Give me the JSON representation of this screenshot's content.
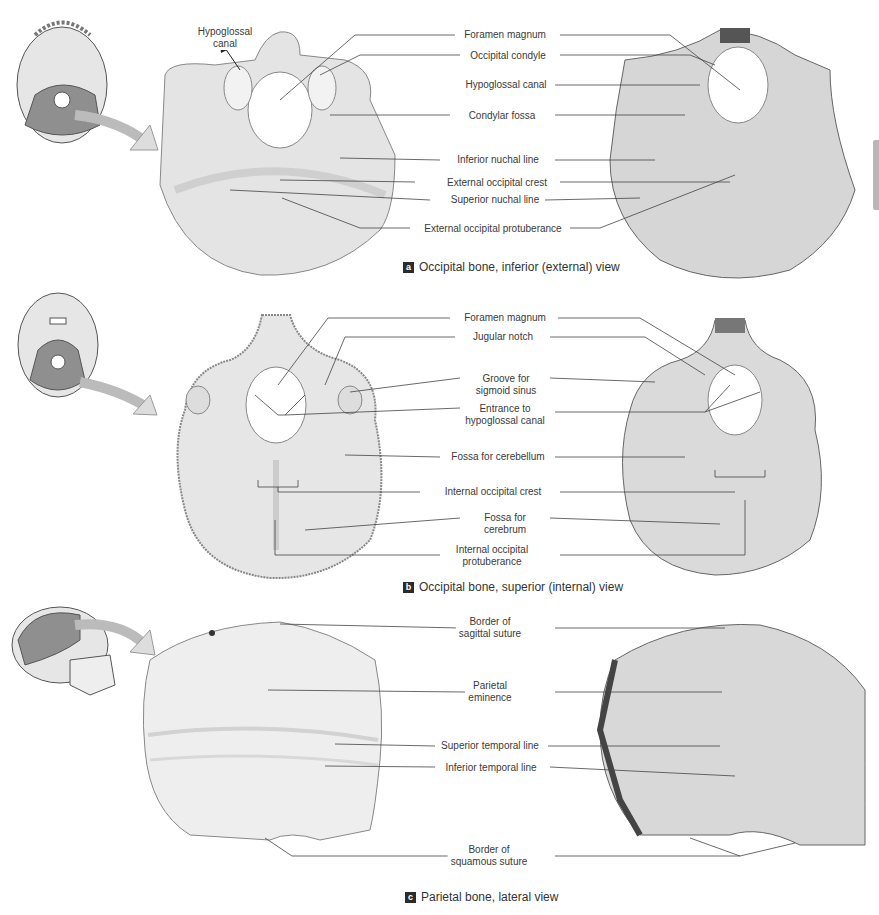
{
  "figure": {
    "panels": [
      {
        "id": "a",
        "caption": "Occipital bone, inferior (external) view",
        "orientation_label": "Hypoglossal canal",
        "orientation_label_lines": [
          "Hypoglossal",
          "canal"
        ],
        "labels": [
          {
            "lines": [
              "Foramen magnum"
            ]
          },
          {
            "lines": [
              "Occipital condyle"
            ]
          },
          {
            "lines": [
              "Hypoglossal canal"
            ]
          },
          {
            "lines": [
              "Condylar fossa"
            ]
          },
          {
            "lines": [
              "Inferior nuchal line"
            ]
          },
          {
            "lines": [
              "External occipital crest"
            ]
          },
          {
            "lines": [
              "Superior nuchal line"
            ]
          },
          {
            "lines": [
              "External occipital protuberance"
            ]
          }
        ]
      },
      {
        "id": "b",
        "caption": "Occipital bone, superior (internal) view",
        "labels": [
          {
            "lines": [
              "Foramen magnum"
            ]
          },
          {
            "lines": [
              "Jugular notch"
            ]
          },
          {
            "lines": [
              "Groove for",
              "sigmoid sinus"
            ]
          },
          {
            "lines": [
              "Entrance to",
              "hypoglossal canal"
            ]
          },
          {
            "lines": [
              "Fossa for cerebellum"
            ]
          },
          {
            "lines": [
              "Internal occipital crest"
            ]
          },
          {
            "lines": [
              "Fossa for",
              "cerebrum"
            ]
          },
          {
            "lines": [
              "Internal occipital",
              "protuberance"
            ]
          }
        ]
      },
      {
        "id": "c",
        "caption": "Parietal bone, lateral view",
        "labels": [
          {
            "lines": [
              "Border of",
              "sagittal suture"
            ]
          },
          {
            "lines": [
              "Parietal",
              "eminence"
            ]
          },
          {
            "lines": [
              "Superior temporal line"
            ]
          },
          {
            "lines": [
              "Inferior temporal line"
            ]
          },
          {
            "lines": [
              "Border of",
              "squamous suture"
            ]
          }
        ]
      }
    ]
  },
  "colors": {
    "bone_light": "#ececec",
    "bone_mid": "#d6d6d6",
    "highlight": "#8f8f8f",
    "leader": "#444444",
    "caption_marker": "#2b2b2b"
  }
}
